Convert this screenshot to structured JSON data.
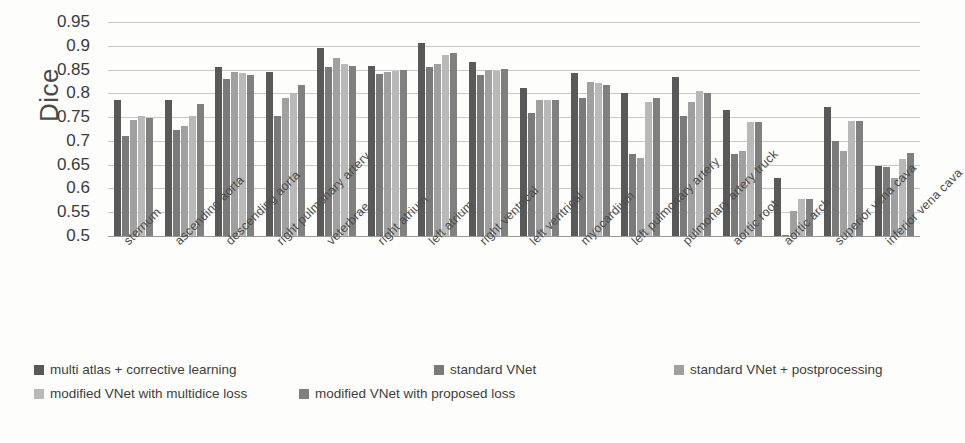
{
  "chart_data": {
    "type": "bar",
    "title": "",
    "xlabel": "",
    "ylabel": "Dice",
    "ylim": [
      0.5,
      0.95
    ],
    "yticks": [
      "0.95",
      "0.9",
      "0.85",
      "0.8",
      "0.75",
      "0.7",
      "0.65",
      "0.6",
      "0.55",
      "0.5"
    ],
    "ytick_values": [
      0.95,
      0.9,
      0.85,
      0.8,
      0.75,
      0.7,
      0.65,
      0.6,
      0.55,
      0.5
    ],
    "grid": true,
    "legend_position": "bottom",
    "categories": [
      "sternum",
      "ascending aorta",
      "descending aorta",
      "right pulmonary artery",
      "veterbrae",
      "right atrium",
      "left atrium",
      "right ventrical",
      "left ventrical",
      "myocardium",
      "left pulmonary artery",
      "pulmonary artery truck",
      "aortic root",
      "aortic arch",
      "superior vena cava",
      "inferior vena cava"
    ],
    "series": [
      {
        "name": "multi atlas + corrective learning",
        "color": "#595959",
        "values": [
          0.785,
          0.787,
          0.855,
          0.845,
          0.895,
          0.858,
          0.905,
          0.865,
          0.812,
          0.843,
          0.8,
          0.835,
          0.765,
          0.622,
          0.772,
          0.648
        ]
      },
      {
        "name": "standard VNet",
        "color": "#7a7a7a",
        "values": [
          0.71,
          0.723,
          0.83,
          0.752,
          0.855,
          0.84,
          0.855,
          0.838,
          0.758,
          0.79,
          0.672,
          0.752,
          0.672,
          0.502,
          0.7,
          0.645
        ]
      },
      {
        "name": "standard VNet + postprocessing",
        "color": "#a0a0a0",
        "values": [
          0.745,
          0.732,
          0.845,
          0.79,
          0.875,
          0.845,
          0.862,
          0.849,
          0.785,
          0.823,
          0.665,
          0.782,
          0.678,
          0.552,
          0.678,
          0.622
        ]
      },
      {
        "name": "modified VNet with multidice loss",
        "color": "#b9b9b9",
        "values": [
          0.752,
          0.752,
          0.843,
          0.8,
          0.862,
          0.848,
          0.88,
          0.848,
          0.785,
          0.822,
          0.782,
          0.805,
          0.74,
          0.578,
          0.742,
          0.662
        ]
      },
      {
        "name": "modified VNet with proposed loss",
        "color": "#808080",
        "values": [
          0.748,
          0.778,
          0.838,
          0.818,
          0.858,
          0.85,
          0.885,
          0.852,
          0.785,
          0.818,
          0.79,
          0.8,
          0.74,
          0.578,
          0.742,
          0.675
        ]
      }
    ]
  },
  "legend": {
    "items": [
      {
        "label": "multi atlas + corrective learning",
        "color": "#595959"
      },
      {
        "label": "standard VNet",
        "color": "#7a7a7a"
      },
      {
        "label": "standard VNet + postprocessing",
        "color": "#a0a0a0"
      },
      {
        "label": "modified VNet with multidice loss",
        "color": "#b9b9b9"
      },
      {
        "label": "modified VNet with proposed loss",
        "color": "#808080"
      }
    ]
  }
}
